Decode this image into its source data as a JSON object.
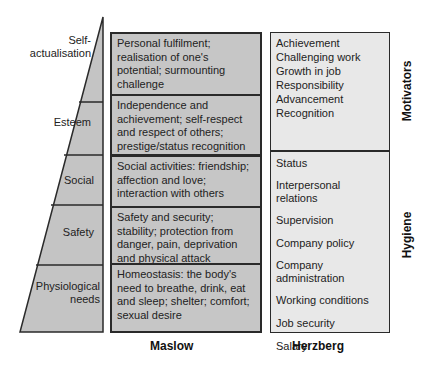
{
  "colors": {
    "maslow_fill": "#c6c6c6",
    "herzberg_fill": "#e8e8e8",
    "pyramid_fill": "#c4c4c4",
    "line": "#2a2a2a"
  },
  "pyramid": {
    "levels": [
      {
        "label_line1": "Self-",
        "label_line2": "actualisation"
      },
      {
        "label_line1": "Esteem"
      },
      {
        "label_line1": "Social"
      },
      {
        "label_line1": "Safety"
      },
      {
        "label_line1": "Physiological",
        "label_line2": "needs"
      }
    ]
  },
  "maslow": {
    "heading": "Maslow",
    "rows": [
      {
        "lines": [
          "Personal fulfilment;",
          "realisation of one's",
          "potential; surmounting",
          "challenge"
        ]
      },
      {
        "lines": [
          "Independence and",
          "achievement; self-respect",
          "and respect of others;",
          "prestige/status recognition"
        ]
      },
      {
        "lines": [
          "Social activities: friendship;",
          "affection and love;",
          "interaction with others"
        ]
      },
      {
        "lines": [
          "Safety and security;",
          "stability; protection from",
          "danger, pain, deprivation",
          "and physical attack"
        ]
      },
      {
        "lines": [
          "Homeostasis: the body's",
          "need to breathe, drink, eat",
          "and sleep; shelter; comfort;",
          "sexual desire"
        ]
      }
    ]
  },
  "herzberg": {
    "heading": "Herzberg",
    "motivators": {
      "label": "Motivators",
      "items": [
        "Achievement",
        "Challenging work",
        "Growth in job",
        "Responsibility",
        "Advancement",
        "Recognition"
      ]
    },
    "hygiene": {
      "label": "Hygiene",
      "items": [
        "Status",
        "Interpersonal",
        "relations",
        "Supervision",
        "Company policy",
        "Company",
        "administration",
        "Working conditions",
        "Job security",
        "Salary"
      ]
    }
  }
}
